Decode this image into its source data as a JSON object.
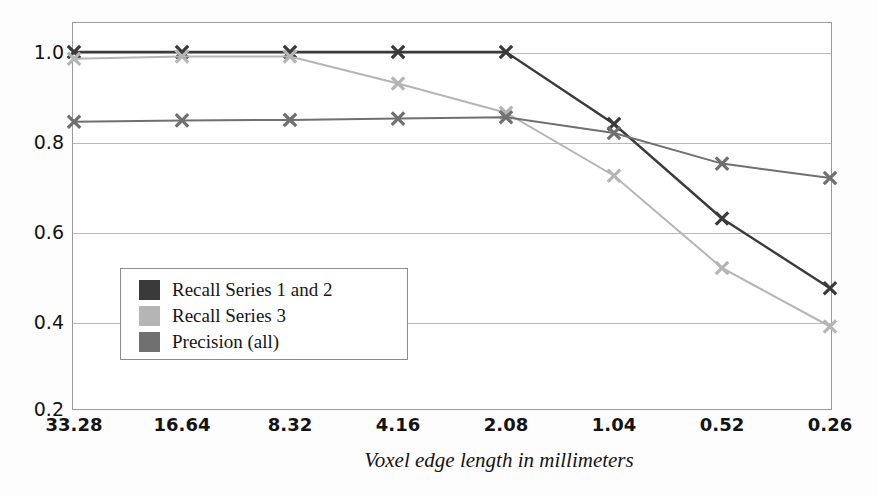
{
  "chart_data": {
    "type": "line",
    "title": "",
    "subtitle": "",
    "xlabel": "Voxel edge length in millimeters",
    "ylabel": "",
    "categories": [
      "33.28",
      "16.64",
      "8.32",
      "4.16",
      "2.08",
      "1.04",
      "0.52",
      "0.26"
    ],
    "x_tick_labels": [
      "33.28",
      "16.64",
      "8.32",
      "4.16",
      "2.08",
      "1.04",
      "0.52",
      "0.26"
    ],
    "y_tick_labels": [
      "1.0",
      "0.8",
      "0.6",
      "0.4",
      "0.2"
    ],
    "y_ticks": [
      1.0,
      0.8,
      0.6,
      0.4,
      0.2
    ],
    "ylim": [
      0.2,
      1.0
    ],
    "grid": "horizontal",
    "legend_position": "lower-left-inside",
    "series": [
      {
        "name": "Recall Series 1 and 2",
        "color": "#3a3a3a",
        "marker": "x",
        "values": [
          1.0,
          1.0,
          1.0,
          1.0,
          1.0,
          0.84,
          0.63,
          0.475
        ]
      },
      {
        "name": "Recall Series 3",
        "color": "#b5b5b5",
        "marker": "x",
        "values": [
          0.985,
          0.99,
          0.99,
          0.93,
          0.865,
          0.725,
          0.52,
          0.39
        ]
      },
      {
        "name": "Precision (all)",
        "color": "#707070",
        "marker": "x",
        "values": [
          0.845,
          0.848,
          0.849,
          0.852,
          0.855,
          0.82,
          0.752,
          0.72
        ]
      }
    ]
  },
  "legend": {
    "items": [
      {
        "label": "Recall Series 1 and 2",
        "color": "#3a3a3a"
      },
      {
        "label": "Recall Series 3",
        "color": "#b5b5b5"
      },
      {
        "label": "Precision (all)",
        "color": "#707070"
      }
    ]
  },
  "axis": {
    "x_title": "Voxel edge length in millimeters"
  }
}
